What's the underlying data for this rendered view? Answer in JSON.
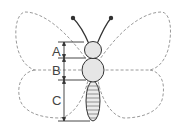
{
  "diagram": {
    "labels": [
      {
        "id": "A",
        "text": "A",
        "segment": "head"
      },
      {
        "id": "B",
        "text": "B",
        "segment": "thorax"
      },
      {
        "id": "C",
        "text": "C",
        "segment": "abdomen"
      }
    ],
    "colors": {
      "outline": "#333333",
      "wing_dashed": "#999999",
      "body_fill": "#e6e6e6"
    }
  }
}
